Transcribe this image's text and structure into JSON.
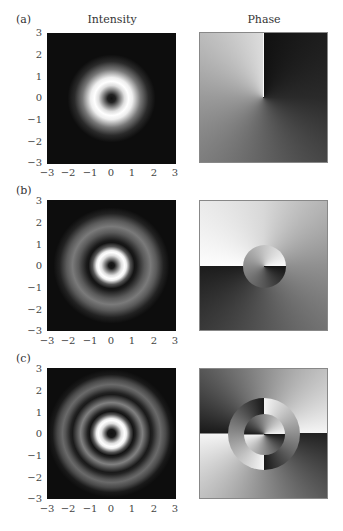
{
  "figure": {
    "column_titles": {
      "intensity": "Intensity",
      "phase": "Phase"
    },
    "rows": [
      {
        "label": "(a)",
        "description": "single bright ring with dark center; phase: one 2π winding, discontinuity along +x"
      },
      {
        "label": "(b)",
        "description": "bright inner ring plus faint outer ring; phase: outer winding with cut along −x, inner disk (r<1) reversed winding with cut along +x"
      },
      {
        "label": "(c)",
        "description": "bright inner ring plus two faint outer rings; phase: charge-2 pattern in three radial zones, middle annulus rotated 90°"
      }
    ],
    "axes": {
      "x_ticks": [
        "−3",
        "−2",
        "−1",
        "0",
        "1",
        "2",
        "3"
      ],
      "y_ticks": [
        "3",
        "2",
        "1",
        "0",
        "−1",
        "−2",
        "−3"
      ],
      "range": [
        -3,
        3
      ]
    },
    "colors": {
      "background": "#ffffff",
      "panel_dark": "#0d0d0d",
      "ring_bright": "#ffffff",
      "text": "#333333"
    }
  }
}
